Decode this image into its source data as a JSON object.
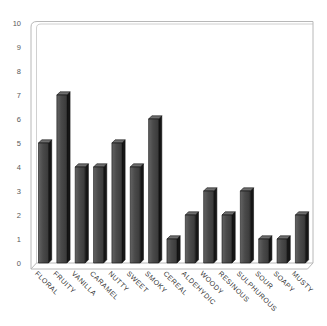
{
  "chart_data": {
    "type": "bar",
    "style": "3d-column",
    "title": "",
    "xlabel": "",
    "ylabel": "",
    "categories": [
      "FLORAL",
      "FRUITY",
      "VANILLA",
      "CARAMEL",
      "NUTTY",
      "SWEET",
      "SMOKY",
      "CEREAL",
      "ALDEHYDIC",
      "WOODY",
      "RESINOUS",
      "SULPHUROUS",
      "SOUR",
      "SOAPY",
      "MUSTY"
    ],
    "values": [
      5,
      7,
      4,
      4,
      5,
      4,
      6,
      1,
      2,
      3,
      2,
      3,
      1,
      1,
      2
    ],
    "ylim": [
      0,
      10
    ],
    "yticks": [
      0,
      1,
      2,
      3,
      4,
      5,
      6,
      7,
      8,
      9,
      10
    ],
    "grid": false,
    "legend": null,
    "colors": {
      "bar_face": "#4a4a4a",
      "bar_face_light": "#636363",
      "bar_side": "#161616",
      "bar_top": "#6e6e6e",
      "bar_outline": "#111111",
      "wall_border": "#b8b8b8",
      "wall_border_light": "#d0d0d0",
      "tick_text": "#595959",
      "category_text": "#333333",
      "background": "#ffffff"
    }
  }
}
